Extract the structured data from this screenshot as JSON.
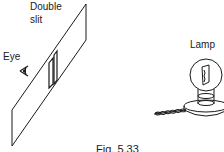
{
  "figure": {
    "labels": {
      "double_slit_line1": "Double",
      "double_slit_line2": "slit",
      "eye": "Eye",
      "lamp": "Lamp"
    },
    "caption": "Fig. 5.33",
    "colors": {
      "ink": "#1a1a1a",
      "background": "#ffffff"
    },
    "icons": [
      "eye-icon",
      "double-slit-plate",
      "lamp-bulb",
      "filament",
      "lamp-base",
      "power-cord"
    ]
  }
}
